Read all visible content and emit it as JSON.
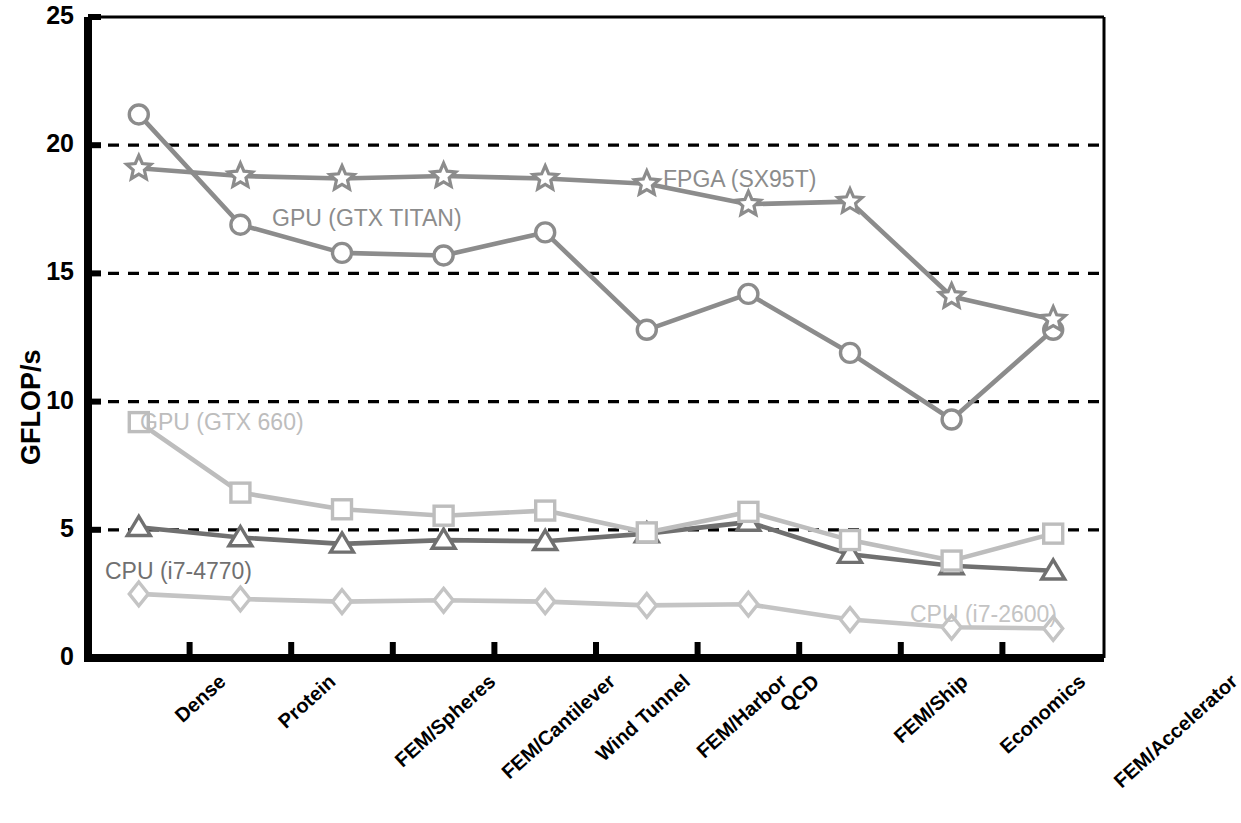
{
  "chart_data": {
    "type": "line",
    "title": "",
    "xlabel": "",
    "ylabel": "GFLOP/s",
    "ylim": [
      0,
      25
    ],
    "yticks": [
      0,
      5,
      10,
      15,
      20,
      25
    ],
    "grid": "horizontal dashed gridlines at 5, 10, 15, 20",
    "legend_position": "inline labels next to series",
    "categories": [
      "Dense",
      "Protein",
      "FEM/Spheres",
      "FEM/Cantilever",
      "Wind Tunnel",
      "FEM/Harbor",
      "QCD",
      "FEM/Ship",
      "Economics",
      "FEM/Accelerator"
    ],
    "series": [
      {
        "name": "FPGA (SX95T)",
        "marker": "star",
        "color": "#8c8c8c",
        "label_x": 663,
        "label_y": 166,
        "values": [
          19.1,
          18.8,
          18.7,
          18.8,
          18.7,
          18.5,
          17.7,
          17.8,
          14.1,
          13.2
        ]
      },
      {
        "name": "GPU (GTX TITAN)",
        "marker": "circle",
        "color": "#8c8c8c",
        "label_x": 272,
        "label_y": 205,
        "values": [
          21.2,
          16.9,
          15.8,
          15.7,
          16.6,
          12.8,
          14.2,
          11.9,
          9.3,
          12.8
        ]
      },
      {
        "name": "GPU (GTX 660)",
        "marker": "square",
        "color": "#bdbdbd",
        "label_x": 140,
        "label_y": 409,
        "values": [
          9.2,
          6.45,
          5.8,
          5.55,
          5.75,
          4.9,
          5.7,
          4.6,
          3.8,
          4.85
        ]
      },
      {
        "name": "CPU (i7-4770)",
        "marker": "triangle",
        "color": "#707070",
        "label_x": 105,
        "label_y": 558,
        "values": [
          5.1,
          4.7,
          4.45,
          4.6,
          4.55,
          4.85,
          5.3,
          4.05,
          3.6,
          3.4
        ]
      },
      {
        "name": "CPU (i7-2600)",
        "marker": "diamond",
        "color": "#c4c4c4",
        "label_x": 910,
        "label_y": 601,
        "values": [
          2.5,
          2.3,
          2.2,
          2.25,
          2.2,
          2.05,
          2.1,
          1.5,
          1.2,
          1.15
        ]
      }
    ]
  },
  "axis": {
    "y_label": "GFLOP/s",
    "ticks": [
      "0",
      "5",
      "10",
      "15",
      "20",
      "25"
    ]
  },
  "colors": {
    "axis": "#000000",
    "grid": "#000000",
    "background": "#ffffff"
  }
}
